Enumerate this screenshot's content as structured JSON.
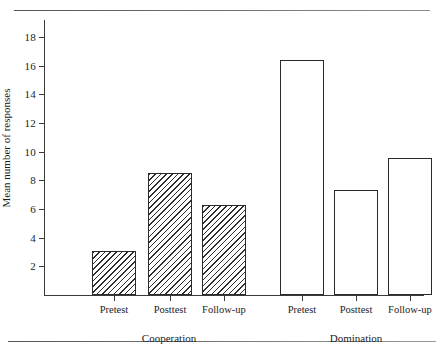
{
  "chart_data": {
    "type": "bar",
    "title": "",
    "xlabel": "",
    "ylabel": "Mean number of responses",
    "ylim": [
      0,
      19.2
    ],
    "yticks": [
      2,
      4,
      6,
      8,
      10,
      12,
      14,
      16,
      18
    ],
    "ytick_labels": [
      "2",
      "4",
      "6",
      "8",
      "10",
      "12",
      "14",
      "16",
      "18"
    ],
    "grid": false,
    "legend": "none",
    "categories": [
      "Pretest",
      "Posttest",
      "Follow-up",
      "Pretest",
      "Posttest",
      "Follow-up"
    ],
    "values": [
      3.1,
      8.5,
      6.3,
      16.4,
      7.3,
      9.6
    ],
    "bars": [
      {
        "label": "Pretest",
        "group": "Cooperation",
        "value": 3.1,
        "fill": "hatched"
      },
      {
        "label": "Posttest",
        "group": "Cooperation",
        "value": 8.5,
        "fill": "hatched"
      },
      {
        "label": "Follow-up",
        "group": "Cooperation",
        "value": 6.3,
        "fill": "hatched"
      },
      {
        "label": "Pretest",
        "group": "Domination",
        "value": 16.4,
        "fill": "open"
      },
      {
        "label": "Posttest",
        "group": "Domination",
        "value": 7.3,
        "fill": "open"
      },
      {
        "label": "Follow-up",
        "group": "Domination",
        "value": 9.6,
        "fill": "open"
      }
    ],
    "groups": [
      {
        "name": "Cooperation",
        "bar_indices": [
          0,
          1,
          2
        ]
      },
      {
        "name": "Domination",
        "bar_indices": [
          3,
          4,
          5
        ]
      }
    ],
    "colors": {
      "axis": "#3a3a3a",
      "bar_outline": "#2a2a2a",
      "hatch": "#2d2d2d",
      "open_fill": "#ffffff",
      "rule": "#6e6e6e",
      "text": "#1c1c1c"
    }
  },
  "axis": {
    "y_title": "Mean number of responses"
  },
  "group_labels": {
    "left": "Cooperation",
    "right": "Domination"
  }
}
